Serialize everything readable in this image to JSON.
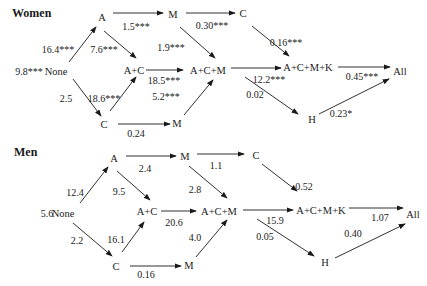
{
  "panels": [
    {
      "title": "Women",
      "nodes": {
        "none": "None",
        "a": "A",
        "c_low": "C",
        "ac": "A+C",
        "m_top": "M",
        "m_low": "M",
        "acm": "A+C+M",
        "c_top": "C",
        "acmk": "A+C+M+K",
        "h": "H",
        "all": "All"
      },
      "edges": {
        "none_value": "9.8***",
        "none_a": "16.4***",
        "none_c": "2.5",
        "a_ac": "7.6***",
        "c_ac": "18.6***",
        "a_m": "1.5***",
        "c_m": "0.24",
        "m_acm": "1.9***",
        "ac_acm": "18.5***",
        "m_low_acm": "5.2***",
        "m_c": "0.30***",
        "c_acmk": "0.16***",
        "acm_acmk": "12.2***",
        "acm_h": "0.02",
        "acmk_all": "0.45***",
        "h_all": "0.23*"
      }
    },
    {
      "title": "Men",
      "nodes": {
        "none": "None",
        "a": "A",
        "c_low": "C",
        "ac": "A+C",
        "m_top": "M",
        "m_low": "M",
        "acm": "A+C+M",
        "c_top": "C",
        "acmk": "A+C+M+K",
        "h": "H",
        "all": "All"
      },
      "edges": {
        "none_value": "5.6",
        "none_a": "12.4",
        "none_c": "2.2",
        "a_ac": "9.5",
        "c_ac": "16.1",
        "a_m": "2.4",
        "c_m": "0.16",
        "m_acm": "2.8",
        "ac_acm": "20.6",
        "m_low_acm": "4.0",
        "m_c": "1.1",
        "c_acmk": "0.52",
        "acm_acmk": "15.9",
        "acm_h": "0.05",
        "acmk_all": "1.07",
        "h_all": "0.40"
      }
    }
  ]
}
